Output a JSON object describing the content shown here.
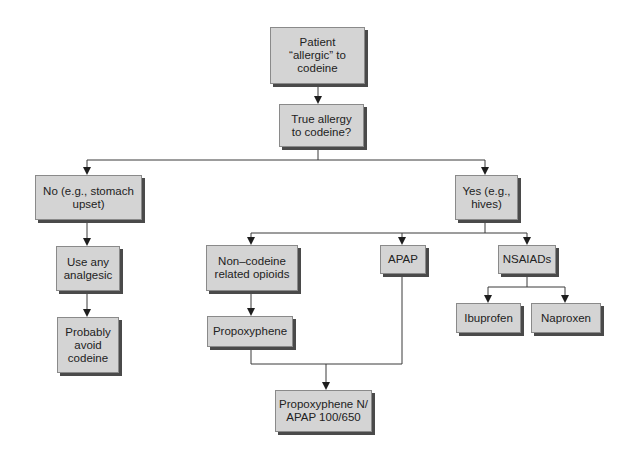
{
  "diagram": {
    "type": "flowchart",
    "colors": {
      "box_fill": "#d4d4d4",
      "box_border": "#8a8a8a",
      "shadow": "#4a4a4a",
      "line": "#3a3a3a",
      "text": "#222222"
    },
    "nodes": {
      "start": {
        "label": "Patient\n“allergic” to\ncodeine"
      },
      "question": {
        "label": "True allergy\nto codeine?"
      },
      "no": {
        "label": "No (e.g., stomach\nupset)"
      },
      "yes": {
        "label": "Yes (e.g.,\nhives)"
      },
      "use_any": {
        "label": "Use any\nanalgesic"
      },
      "avoid": {
        "label": "Probably\navoid\ncodeine"
      },
      "non_codeine": {
        "label": "Non–codeine\nrelated opioids"
      },
      "apap": {
        "label": "APAP"
      },
      "nsaiads": {
        "label": "NSAIADs"
      },
      "propoxyphene": {
        "label": "Propoxyphene"
      },
      "ibuprofen": {
        "label": "Ibuprofen"
      },
      "naproxen": {
        "label": "Naproxen"
      },
      "combo": {
        "label": "Propoxyphene N/\nAPAP 100/650"
      }
    },
    "edges": [
      {
        "from": "start",
        "to": "question"
      },
      {
        "from": "question",
        "to": "no"
      },
      {
        "from": "question",
        "to": "yes"
      },
      {
        "from": "no",
        "to": "use_any"
      },
      {
        "from": "use_any",
        "to": "avoid"
      },
      {
        "from": "yes",
        "to": "non_codeine"
      },
      {
        "from": "yes",
        "to": "apap"
      },
      {
        "from": "yes",
        "to": "nsaiads"
      },
      {
        "from": "non_codeine",
        "to": "propoxyphene"
      },
      {
        "from": "nsaiads",
        "to": "ibuprofen"
      },
      {
        "from": "nsaiads",
        "to": "naproxen"
      },
      {
        "from": "propoxyphene",
        "to": "combo"
      },
      {
        "from": "apap",
        "to": "combo"
      }
    ]
  }
}
